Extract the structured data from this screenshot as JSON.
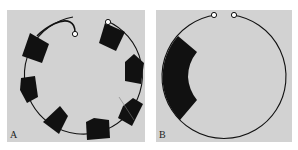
{
  "figure": {
    "panels": [
      {
        "id": "A",
        "label": "A",
        "description": "Ring with eight black segments and an open loop with two hooks at top"
      },
      {
        "id": "B",
        "label": "B",
        "description": "Ring with one large black crescent segment on left, two loop ends at top"
      }
    ]
  },
  "colors": {
    "panel_bg": "#d2d2d2",
    "ink": "#111111"
  }
}
